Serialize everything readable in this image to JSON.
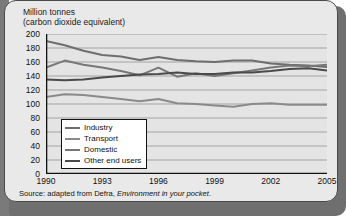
{
  "card": {
    "axis_title_line1": "Million tonnes",
    "axis_title_line2": "(carbon dioxide equivalent)",
    "source_prefix": "Source: adapted from Defra, ",
    "source_italic": "Environment in your pocket",
    "source_suffix": "."
  },
  "chart_data": {
    "type": "line",
    "xlabel": "",
    "ylabel": "Million tonnes (carbon dioxide equivalent)",
    "ylim": [
      0,
      200
    ],
    "xlim": [
      1990,
      2005
    ],
    "ytick_step": 20,
    "yticks": [
      0,
      20,
      40,
      60,
      80,
      100,
      120,
      140,
      160,
      180,
      200
    ],
    "x": [
      1990,
      1991,
      1992,
      1993,
      1994,
      1995,
      1996,
      1997,
      1998,
      1999,
      2000,
      2001,
      2002,
      2003,
      2004,
      2005
    ],
    "xticks": [
      1990,
      1993,
      1996,
      1999,
      2002,
      2005
    ],
    "grid": true,
    "legend_position": "inside-lower-left",
    "series": [
      {
        "name": "Industry",
        "color": "#6e6e6e",
        "values": [
          190,
          184,
          176,
          170,
          168,
          163,
          167,
          163,
          161,
          160,
          162,
          162,
          158,
          156,
          155,
          153
        ]
      },
      {
        "name": "Transport",
        "color": "#8a8a8a",
        "values": [
          110,
          114,
          113,
          110,
          107,
          104,
          107,
          101,
          100,
          98,
          96,
          100,
          101,
          99,
          99,
          99
        ]
      },
      {
        "name": "Domestic",
        "color": "#777777",
        "values": [
          152,
          162,
          156,
          152,
          147,
          141,
          152,
          139,
          144,
          140,
          144,
          148,
          152,
          155,
          154,
          156
        ]
      },
      {
        "name": "Other end users",
        "color": "#4a4a4a",
        "values": [
          135,
          134,
          135,
          138,
          140,
          142,
          143,
          145,
          143,
          143,
          145,
          145,
          147,
          150,
          151,
          148
        ]
      }
    ],
    "legend": [
      "Industry",
      "Transport",
      "Domestic",
      "Other end users"
    ]
  }
}
